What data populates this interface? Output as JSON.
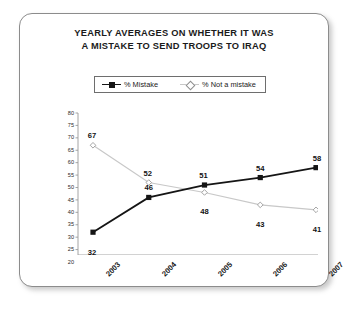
{
  "chart_data": {
    "type": "line",
    "title": "YEARLY AVERAGES ON WHETHER IT WAS A MISTAKE TO SEND TROOPS TO IRAQ",
    "title_line1": "YEARLY AVERAGES ON WHETHER IT WAS",
    "title_line2": "A MISTAKE TO SEND TROOPS TO IRAQ",
    "xlabel": "",
    "ylabel": "",
    "categories": [
      "2003",
      "2004",
      "2005",
      "2006",
      "2007"
    ],
    "series": [
      {
        "name": "% Mistake",
        "values": [
          32,
          46,
          51,
          54,
          58
        ],
        "color": "#151515",
        "marker": "filled-square"
      },
      {
        "name": "% Not a mistake",
        "values": [
          67,
          52,
          48,
          43,
          41
        ],
        "color": "#c8c8c8",
        "marker": "open-diamond"
      }
    ],
    "ylim": [
      20,
      80
    ],
    "yticks": [
      80,
      75,
      70,
      65,
      60,
      55,
      50,
      45,
      40,
      35,
      30,
      25,
      20
    ],
    "grid": false,
    "legend_position": "top-center"
  },
  "legend": {
    "items": [
      {
        "label": "% Mistake"
      },
      {
        "label": "% Not a mistake"
      }
    ]
  },
  "colors": {
    "mistake_line": "#151515",
    "not_mistake_line": "#c8c8c8",
    "axis": "#9a9a9a",
    "card_border": "#8c8c8c",
    "text": "#1b1b1b"
  }
}
